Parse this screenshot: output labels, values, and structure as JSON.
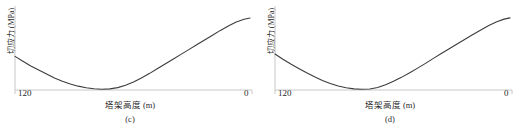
{
  "figure": {
    "panels": [
      {
        "caption": "(c)",
        "xlabel": "塔架高度 (m)",
        "ylabel": "切应力 (MPa)",
        "xticks": [
          "120",
          "0"
        ]
      },
      {
        "caption": "(d)",
        "xlabel": "塔架高度 (m)",
        "ylabel": "切应力 (MPa)",
        "xticks": [
          "120",
          "0"
        ]
      }
    ]
  },
  "colors": {
    "curve": "#3c3c3c",
    "axis": "#c8c8c8",
    "text": "#2b2b2b",
    "background": "#ffffff"
  },
  "chart_data": [
    {
      "type": "line",
      "title": "(c)",
      "xlabel": "塔架高度 (m)",
      "ylabel": "切应力 (MPa)",
      "xlim": [
        120,
        0
      ],
      "ylim": [
        0,
        1
      ],
      "xticks": [
        120,
        0
      ],
      "xticklabels": [
        "120",
        "0"
      ],
      "yticks": [],
      "yticklabels": [],
      "grid": false,
      "legend": null,
      "x": [
        120,
        116,
        112,
        108,
        104,
        100,
        96,
        92,
        88,
        84,
        80,
        76,
        72,
        68,
        64,
        60,
        56,
        52,
        48,
        44,
        40,
        36,
        32,
        28,
        24,
        20,
        16,
        12,
        8,
        4,
        1
      ],
      "y": [
        0.42,
        0.36,
        0.3,
        0.25,
        0.2,
        0.15,
        0.11,
        0.075,
        0.048,
        0.028,
        0.015,
        0.01,
        0.014,
        0.03,
        0.06,
        0.1,
        0.15,
        0.205,
        0.265,
        0.325,
        0.385,
        0.445,
        0.505,
        0.565,
        0.625,
        0.685,
        0.745,
        0.8,
        0.85,
        0.885,
        0.9
      ],
      "series": [
        {
          "name": "切应力",
          "values": [
            0.42,
            0.36,
            0.3,
            0.25,
            0.2,
            0.15,
            0.11,
            0.075,
            0.048,
            0.028,
            0.015,
            0.01,
            0.014,
            0.03,
            0.06,
            0.1,
            0.15,
            0.205,
            0.265,
            0.325,
            0.385,
            0.445,
            0.505,
            0.565,
            0.625,
            0.685,
            0.745,
            0.8,
            0.85,
            0.885,
            0.9
          ]
        }
      ]
    },
    {
      "type": "line",
      "title": "(d)",
      "xlabel": "塔架高度 (m)",
      "ylabel": "切应力 (MPa)",
      "xlim": [
        120,
        0
      ],
      "ylim": [
        0,
        1
      ],
      "xticks": [
        120,
        0
      ],
      "xticklabels": [
        "120",
        "0"
      ],
      "yticks": [],
      "yticklabels": [],
      "grid": false,
      "legend": null,
      "x": [
        120,
        116,
        112,
        108,
        104,
        100,
        96,
        92,
        88,
        84,
        80,
        76,
        72,
        68,
        64,
        60,
        56,
        52,
        48,
        44,
        40,
        36,
        32,
        28,
        24,
        20,
        16,
        12,
        8,
        4,
        1
      ],
      "y": [
        0.45,
        0.385,
        0.325,
        0.27,
        0.215,
        0.165,
        0.12,
        0.082,
        0.05,
        0.028,
        0.014,
        0.009,
        0.013,
        0.032,
        0.065,
        0.108,
        0.158,
        0.212,
        0.27,
        0.33,
        0.392,
        0.452,
        0.512,
        0.572,
        0.632,
        0.69,
        0.748,
        0.802,
        0.85,
        0.886,
        0.902
      ],
      "series": [
        {
          "name": "切应力",
          "values": [
            0.45,
            0.385,
            0.325,
            0.27,
            0.215,
            0.165,
            0.12,
            0.082,
            0.05,
            0.028,
            0.014,
            0.009,
            0.013,
            0.032,
            0.065,
            0.108,
            0.158,
            0.212,
            0.27,
            0.33,
            0.392,
            0.452,
            0.512,
            0.572,
            0.632,
            0.69,
            0.748,
            0.802,
            0.85,
            0.886,
            0.902
          ]
        }
      ]
    }
  ]
}
